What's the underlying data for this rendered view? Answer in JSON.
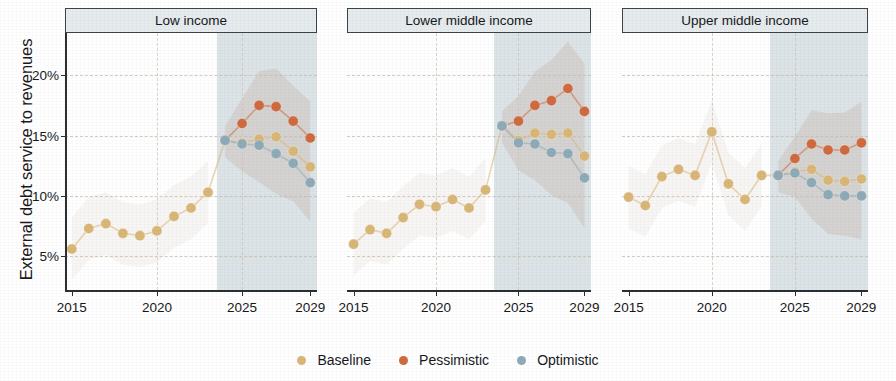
{
  "chart_data": {
    "type": "line",
    "title": "",
    "ylabel": "External debt service to revenues",
    "xlabel": "",
    "ylim": [
      2.2,
      23.5
    ],
    "xlim": [
      2014.6,
      2029.4
    ],
    "ytick_values": [
      5,
      10,
      15,
      20
    ],
    "ytick_labels": [
      "5%",
      "10%",
      "15%",
      "20%"
    ],
    "xtick_values": [
      2015,
      2020,
      2025,
      2029
    ],
    "xtick_labels": [
      "2015",
      "2020",
      "2025",
      "2029"
    ],
    "grid": "dashed, both axes",
    "legend_position": "bottom-center",
    "forecast_start": 2023.5,
    "forecast_shading_label": "projection period (shaded)",
    "colors": {
      "baseline": "#d9b778",
      "pessimistic": "#cf6b40",
      "optimistic": "#8fabb8",
      "forecast_band": "#d6dfe4",
      "uncertainty_band": "#cbbcb0",
      "panel_strip": "#e6ebee",
      "axis": "#2b2f31"
    },
    "legend": [
      {
        "name": "Baseline",
        "color": "#d9b778"
      },
      {
        "name": "Pessimistic",
        "color": "#cf6b40"
      },
      {
        "name": "Optimistic",
        "color": "#8fabb8"
      }
    ],
    "panels": [
      {
        "label": "Low income",
        "x": [
          2015,
          2016,
          2017,
          2018,
          2019,
          2020,
          2021,
          2022,
          2023,
          2024,
          2025,
          2026,
          2027,
          2028,
          2029
        ],
        "series": [
          {
            "name": "Baseline",
            "color": "#d9b778",
            "values": [
              5.6,
              7.3,
              7.7,
              6.9,
              6.7,
              7.1,
              8.3,
              9.0,
              10.3,
              14.6,
              14.4,
              14.7,
              14.9,
              13.7,
              12.4
            ]
          },
          {
            "name": "Pessimistic",
            "color": "#cf6b40",
            "values": [
              null,
              null,
              null,
              null,
              null,
              null,
              null,
              null,
              null,
              14.6,
              16.0,
              17.5,
              17.4,
              16.2,
              14.8
            ]
          },
          {
            "name": "Optimistic",
            "color": "#8fabb8",
            "values": [
              null,
              null,
              null,
              null,
              null,
              null,
              null,
              null,
              null,
              14.6,
              14.3,
              14.2,
              13.5,
              12.7,
              11.1
            ]
          }
        ]
      },
      {
        "label": "Lower middle income",
        "x": [
          2015,
          2016,
          2017,
          2018,
          2019,
          2020,
          2021,
          2022,
          2023,
          2024,
          2025,
          2026,
          2027,
          2028,
          2029
        ],
        "series": [
          {
            "name": "Baseline",
            "color": "#d9b778",
            "values": [
              6.0,
              7.2,
              6.9,
              8.2,
              9.3,
              9.1,
              9.7,
              9.0,
              10.5,
              15.8,
              14.6,
              15.2,
              15.1,
              15.2,
              13.3
            ]
          },
          {
            "name": "Pessimistic",
            "color": "#cf6b40",
            "values": [
              null,
              null,
              null,
              null,
              null,
              null,
              null,
              null,
              null,
              15.8,
              16.2,
              17.5,
              17.9,
              18.9,
              17.0
            ]
          },
          {
            "name": "Optimistic",
            "color": "#8fabb8",
            "values": [
              null,
              null,
              null,
              null,
              null,
              null,
              null,
              null,
              null,
              15.8,
              14.4,
              14.3,
              13.6,
              13.5,
              11.5
            ]
          }
        ]
      },
      {
        "label": "Upper middle income",
        "x": [
          2015,
          2016,
          2017,
          2018,
          2019,
          2020,
          2021,
          2022,
          2023,
          2024,
          2025,
          2026,
          2027,
          2028,
          2029
        ],
        "series": [
          {
            "name": "Baseline",
            "color": "#d9b778",
            "values": [
              9.9,
              9.2,
              11.6,
              12.2,
              11.7,
              15.3,
              11.0,
              9.7,
              11.7,
              11.7,
              12.0,
              12.2,
              11.3,
              11.2,
              11.4
            ]
          },
          {
            "name": "Pessimistic",
            "color": "#cf6b40",
            "values": [
              null,
              null,
              null,
              null,
              null,
              null,
              null,
              null,
              null,
              11.7,
              13.1,
              14.3,
              13.8,
              13.8,
              14.4
            ]
          },
          {
            "name": "Optimistic",
            "color": "#8fabb8",
            "values": [
              null,
              null,
              null,
              null,
              null,
              null,
              null,
              null,
              null,
              11.7,
              11.9,
              11.1,
              10.1,
              10.0,
              10.0
            ]
          }
        ]
      }
    ]
  },
  "legend": {
    "items": [
      {
        "label": "Baseline"
      },
      {
        "label": "Pessimistic"
      },
      {
        "label": "Optimistic"
      }
    ]
  },
  "axis": {
    "y_title": "External debt service to revenues"
  }
}
